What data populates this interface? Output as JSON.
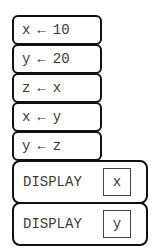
{
  "diagram": {
    "type": "block-based pseudocode program",
    "statements": [
      {
        "kind": "assign",
        "variable": "x",
        "arrow": "←",
        "value": "10"
      },
      {
        "kind": "assign",
        "variable": "y",
        "arrow": "←",
        "value": "20"
      },
      {
        "kind": "assign",
        "variable": "z",
        "arrow": "←",
        "value": "x"
      },
      {
        "kind": "assign",
        "variable": "x",
        "arrow": "←",
        "value": "y"
      },
      {
        "kind": "assign",
        "variable": "y",
        "arrow": "←",
        "value": "z"
      },
      {
        "kind": "display",
        "label": "DISPLAY",
        "argument": "x"
      },
      {
        "kind": "display",
        "label": "DISPLAY",
        "argument": "y"
      }
    ]
  },
  "colors": {
    "block_border": "#111111",
    "text": "#3a3a3a",
    "background": "#ffffff"
  }
}
